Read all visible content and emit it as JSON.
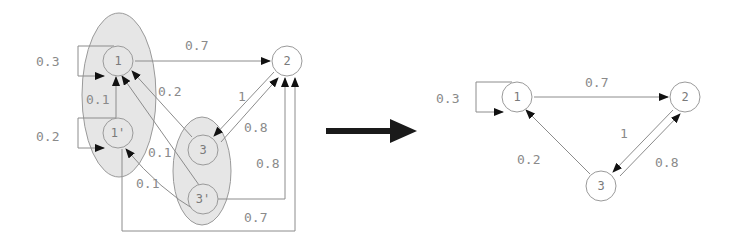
{
  "colors": {
    "background": "#ffffff",
    "edge": "#8c8c8c",
    "arrowhead": "#111111",
    "cluster_fill": "#e6e6e6",
    "cluster_stroke": "#9a9a9a",
    "node_stroke": "#9a9a9a",
    "label": "#8a8a8a",
    "transform_arrow": "#1a1a1a"
  },
  "left_diagram": {
    "clusters": [
      {
        "id": "cluster-1",
        "members": [
          "1",
          "1'"
        ]
      },
      {
        "id": "cluster-3",
        "members": [
          "3",
          "3'"
        ]
      }
    ],
    "nodes": [
      {
        "id": "1",
        "label": "1"
      },
      {
        "id": "1p",
        "label": "1'"
      },
      {
        "id": "2",
        "label": "2"
      },
      {
        "id": "3",
        "label": "3"
      },
      {
        "id": "3p",
        "label": "3'"
      }
    ],
    "edges": [
      {
        "from": "1",
        "to": "1",
        "label": "0.3"
      },
      {
        "from": "1'",
        "to": "1'",
        "label": "0.2"
      },
      {
        "from": "1'",
        "to": "1",
        "label": "0.1"
      },
      {
        "from": "1",
        "to": "2",
        "label": "0.7"
      },
      {
        "from": "3",
        "to": "1",
        "label": "0.2"
      },
      {
        "from": "3'",
        "to": "1",
        "label": "0.1"
      },
      {
        "from": "3'",
        "to": "1'",
        "label": "0.1"
      },
      {
        "from": "2",
        "to": "3",
        "label": "1"
      },
      {
        "from": "3",
        "to": "2",
        "label": "0.8"
      },
      {
        "from": "3'",
        "to": "2",
        "label": "0.8"
      },
      {
        "from": "1'",
        "to": "2",
        "label": "0.7"
      }
    ]
  },
  "right_diagram": {
    "nodes": [
      {
        "id": "1",
        "label": "1"
      },
      {
        "id": "2",
        "label": "2"
      },
      {
        "id": "3",
        "label": "3"
      }
    ],
    "edges": [
      {
        "from": "1",
        "to": "1",
        "label": "0.3"
      },
      {
        "from": "1",
        "to": "2",
        "label": "0.7"
      },
      {
        "from": "2",
        "to": "3",
        "label": "1"
      },
      {
        "from": "3",
        "to": "2",
        "label": "0.8"
      },
      {
        "from": "3",
        "to": "1",
        "label": "0.2"
      }
    ]
  },
  "transform_arrow": {
    "label": ""
  }
}
